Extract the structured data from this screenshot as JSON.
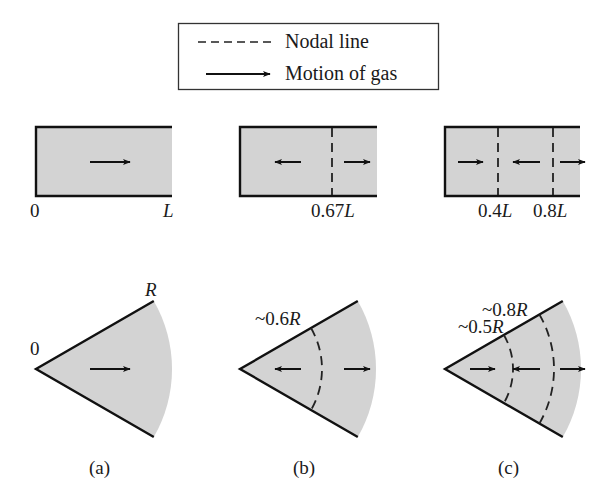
{
  "legend": {
    "items": [
      {
        "symbol": "dashed-line",
        "label": "Nodal line"
      },
      {
        "symbol": "arrow",
        "label": "Motion of gas"
      }
    ]
  },
  "colors": {
    "fill": "#d3d3d3",
    "stroke": "#111111",
    "background": "#ffffff"
  },
  "panels": [
    {
      "caption": "(a)",
      "tube": {
        "start_label": "0",
        "end_label": "L",
        "nodal_lines": [],
        "arrows": [
          "right"
        ]
      },
      "sector": {
        "apex_label": "0",
        "radius_label": "R",
        "nodal_arcs": [],
        "arrows": [
          "right"
        ]
      }
    },
    {
      "caption": "(b)",
      "tube": {
        "nodal_lines": [
          {
            "position": 0.67,
            "label_num": "0.67",
            "label_var": "L"
          }
        ],
        "arrows": [
          "left",
          "right"
        ]
      },
      "sector": {
        "nodal_arcs": [
          {
            "position": 0.6,
            "label_num": "~0.6",
            "label_var": "R"
          }
        ],
        "arrows": [
          "left",
          "right"
        ]
      }
    },
    {
      "caption": "(c)",
      "tube": {
        "nodal_lines": [
          {
            "position": 0.4,
            "label_num": "0.4",
            "label_var": "L"
          },
          {
            "position": 0.8,
            "label_num": "0.8",
            "label_var": "L"
          }
        ],
        "arrows": [
          "right",
          "left",
          "right"
        ]
      },
      "sector": {
        "nodal_arcs": [
          {
            "position": 0.5,
            "label_num": "~0.5",
            "label_var": "R"
          },
          {
            "position": 0.8,
            "label_num": "~0.8",
            "label_var": "R"
          }
        ],
        "arrows": [
          "right",
          "left",
          "right"
        ]
      }
    }
  ]
}
